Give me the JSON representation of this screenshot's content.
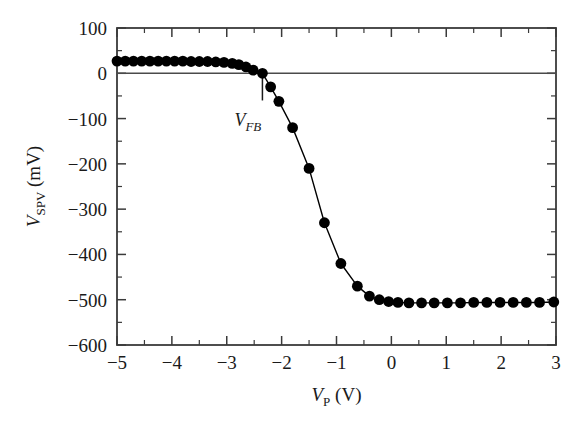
{
  "chart_data": {
    "type": "line",
    "title": "",
    "subtitle": "",
    "xlabel": "V_P (V)",
    "ylabel": "V_SPV (mV)",
    "xlabel_parts": {
      "symbol": "V",
      "subscript": "P",
      "unit": "(V)"
    },
    "ylabel_parts": {
      "symbol": "V",
      "subscript": "SPV",
      "unit": "(mV)"
    },
    "xlim": [
      -5,
      3
    ],
    "ylim": [
      -600,
      100
    ],
    "xticks": [
      -5,
      -4,
      -3,
      -2,
      -1,
      0,
      1,
      2,
      3
    ],
    "xtick_labels": [
      "−5",
      "−4",
      "−3",
      "−2",
      "−1",
      "0",
      "1",
      "2",
      "3"
    ],
    "yticks": [
      -600,
      -500,
      -400,
      -300,
      -200,
      -100,
      0,
      100
    ],
    "ytick_labels": [
      "−600",
      "−500",
      "−400",
      "−300",
      "−200",
      "−100",
      "0",
      "100"
    ],
    "x_minor_step": 0.5,
    "y_minor_step": 50,
    "grid": false,
    "legend": null,
    "marker": "filled-circle",
    "marker_color": "#000000",
    "line_color": "#000000",
    "frame_color": "#3a3a3a",
    "annotations": [
      {
        "name": "flatband-voltage",
        "label": "V_FB",
        "symbol": "V",
        "subscript": "FB",
        "x": -2.35,
        "y": 0
      }
    ],
    "reference_lines": [
      {
        "name": "zero-line",
        "orientation": "horizontal",
        "y": 0
      },
      {
        "name": "vfb-marker",
        "orientation": "vertical",
        "x": -2.35,
        "y_from": 0,
        "y_to": -60
      }
    ],
    "series": [
      {
        "name": "SPV",
        "x": [
          -5.0,
          -4.85,
          -4.7,
          -4.55,
          -4.4,
          -4.25,
          -4.1,
          -3.95,
          -3.8,
          -3.65,
          -3.5,
          -3.35,
          -3.2,
          -3.05,
          -2.9,
          -2.78,
          -2.65,
          -2.52,
          -2.35,
          -2.2,
          -2.05,
          -1.8,
          -1.5,
          -1.22,
          -0.92,
          -0.62,
          -0.4,
          -0.22,
          -0.05,
          0.12,
          0.32,
          0.55,
          0.78,
          1.02,
          1.26,
          1.5,
          1.74,
          1.98,
          2.22,
          2.46,
          2.7,
          2.96
        ],
        "y": [
          27,
          27,
          27,
          27,
          27,
          27,
          27,
          27,
          27,
          26,
          26,
          26,
          25,
          24,
          22,
          19,
          14,
          7,
          0,
          -30,
          -62,
          -120,
          -210,
          -330,
          -420,
          -470,
          -492,
          -500,
          -504,
          -506,
          -507,
          -507,
          -507,
          -507,
          -507,
          -506,
          -506,
          -506,
          -506,
          -506,
          -506,
          -505
        ]
      }
    ]
  }
}
